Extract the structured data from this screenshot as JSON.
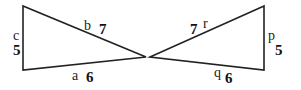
{
  "diagram": {
    "stroke_color": "#222222",
    "triangles": [
      {
        "name": "left-triangle",
        "vertices": [
          [
            23,
            6
          ],
          [
            23,
            70
          ],
          [
            146,
            57
          ]
        ],
        "sides": [
          {
            "letter": "c",
            "length": "5"
          },
          {
            "letter": "b",
            "length": "7"
          },
          {
            "letter": "a",
            "length": "6"
          }
        ]
      },
      {
        "name": "right-triangle",
        "vertices": [
          [
            150,
            57
          ],
          [
            264,
            6
          ],
          [
            264,
            70
          ]
        ],
        "sides": [
          {
            "letter": "r",
            "length": "7"
          },
          {
            "letter": "p",
            "length": "5"
          },
          {
            "letter": "q",
            "length": "6"
          }
        ]
      }
    ]
  }
}
